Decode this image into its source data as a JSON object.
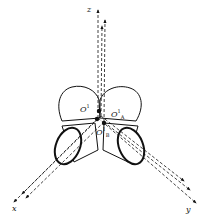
{
  "diagram": {
    "type": "3d-coordinate-frame-with-cylinders",
    "axes": {
      "x": "x",
      "y": "y",
      "z": "z"
    },
    "points": {
      "origin": {
        "base": "O",
        "sup": "1",
        "sub": ""
      },
      "a": {
        "base": "O",
        "sup": "1",
        "sub": "A"
      },
      "b": {
        "base": "O",
        "sup": "1",
        "sub": "B"
      }
    },
    "colors": {
      "stroke": "#111111",
      "background": "#ffffff"
    }
  }
}
